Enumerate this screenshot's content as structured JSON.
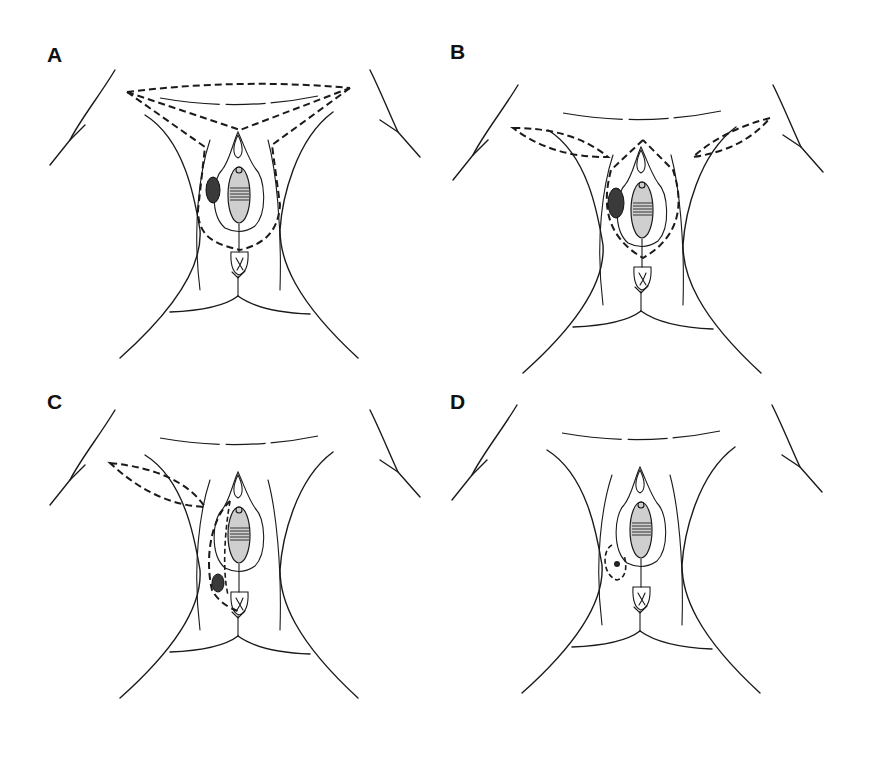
{
  "figure": {
    "panels": [
      {
        "id": "A",
        "label": "A",
        "flaps": "bilateral-connected-v-y",
        "lesion": "large-left"
      },
      {
        "id": "B",
        "label": "B",
        "flaps": "bilateral-separate",
        "lesion": "large-left"
      },
      {
        "id": "C",
        "label": "C",
        "flaps": "unilateral-left",
        "lesion": "medium-left-lower"
      },
      {
        "id": "D",
        "label": "D",
        "flaps": "none",
        "lesion": "small-left-local-excision"
      }
    ],
    "colors": {
      "line": "#1a1a1a",
      "background": "#ffffff",
      "lesion": "#3a3a3a"
    }
  }
}
